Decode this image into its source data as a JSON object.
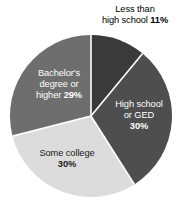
{
  "chart_data": {
    "type": "pie",
    "title": "",
    "subtitle": "",
    "xlabel": "",
    "ylabel": "",
    "legend_position": "none",
    "grid": false,
    "start_angle_deg": 0,
    "direction": "clockwise",
    "categories": [
      "Less than high school",
      "High school or GED",
      "Some college",
      "Bachelor's degree or higher"
    ],
    "values": [
      11,
      30,
      30,
      29
    ],
    "value_unit": "%",
    "colors": [
      "#3a3a3a",
      "#4e4e4e",
      "#dcdcdc",
      "#6e6e6e"
    ],
    "slices": [
      {
        "name": "Less than high school",
        "value": 11,
        "value_label": "11%",
        "color": "#3a3a3a",
        "label_placement": "outside",
        "label_lines": [
          "Less than",
          "high school 11%"
        ],
        "has_leader_line": true
      },
      {
        "name": "High school or GED",
        "value": 30,
        "value_label": "30%",
        "color": "#4e4e4e",
        "label_placement": "inside",
        "label_lines": [
          "High school",
          "or GED",
          "30%"
        ],
        "has_leader_line": false
      },
      {
        "name": "Some college",
        "value": 30,
        "value_label": "30%",
        "color": "#dcdcdc",
        "label_placement": "inside",
        "label_lines": [
          "Some college",
          "30%"
        ],
        "has_leader_line": false
      },
      {
        "name": "Bachelor's degree or higher",
        "value": 29,
        "value_label": "29%",
        "color": "#6e6e6e",
        "label_placement": "inside",
        "label_lines": [
          "Bachelor's",
          "degree or",
          "higher 29%"
        ],
        "has_leader_line": false
      }
    ]
  },
  "labels": {
    "less_than_hs": {
      "line1": "Less than",
      "line2_text": "high school ",
      "line2_value": "11%"
    },
    "high_school": {
      "line1": "High school",
      "line2": "or GED",
      "line3_value": "30%"
    },
    "some_college": {
      "line1": "Some college",
      "line2_value": "30%"
    },
    "bachelors": {
      "line1": "Bachelor's",
      "line2": "degree or",
      "line3_text": "higher ",
      "line3_value": "29%"
    }
  },
  "style": {
    "background": "#ffffff",
    "divider_color": "#ffffff",
    "leader_color": "#ffffff",
    "text_light": "#ffffff",
    "text_dark": "#1a1a1a",
    "text_outside": "#000000"
  },
  "geometry": {
    "center_x": 91,
    "center_y": 116,
    "radius": 81
  }
}
